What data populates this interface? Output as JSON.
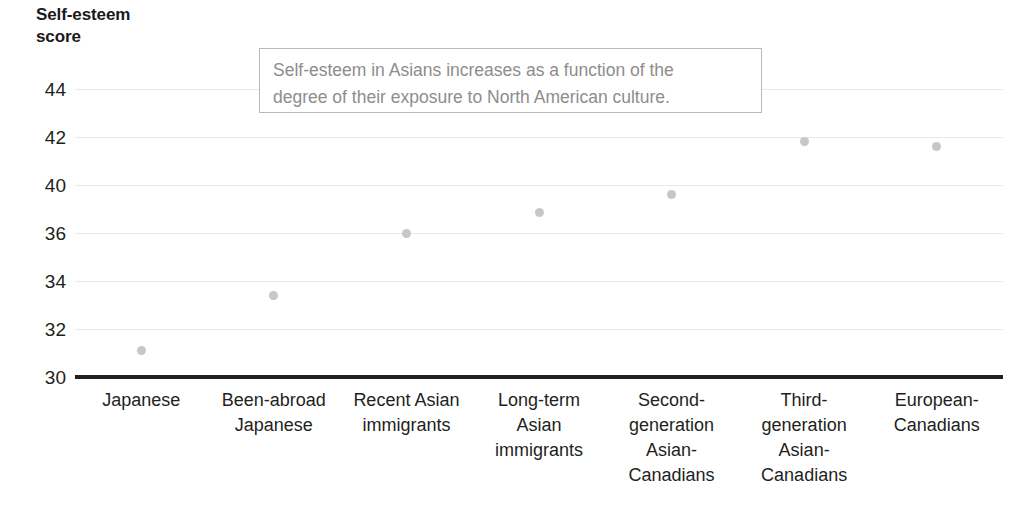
{
  "chart_data": {
    "type": "scatter",
    "ylabel": "Self-esteem score",
    "xlabel": "",
    "categories": [
      "Japanese",
      "Been-abroad Japanese",
      "Recent Asian immigrants",
      "Long-term Asian immigrants",
      "Second-generation Asian-Canadians",
      "Third-generation Asian-Canadians",
      "European-Canadians"
    ],
    "category_lines": [
      [
        "Japanese"
      ],
      [
        "Been-abroad",
        "Japanese"
      ],
      [
        "Recent Asian",
        "immigrants"
      ],
      [
        "Long-term",
        "Asian",
        "immigrants"
      ],
      [
        "Second-",
        "generation",
        "Asian-",
        "Canadians"
      ],
      [
        "Third-",
        "generation",
        "Asian-",
        "Canadians"
      ],
      [
        "European-",
        "Canadians"
      ]
    ],
    "values": [
      31.1,
      33.4,
      36.0,
      37.7,
      39.2,
      41.8,
      41.6
    ],
    "ytick_labels": [
      "44",
      "42",
      "40",
      "36",
      "34",
      "32",
      "30"
    ],
    "ylim": [
      30,
      44
    ],
    "grid": true,
    "legend": "none",
    "annotations": [
      {
        "text": "Self-esteem in Asians increases as a function of the degree of their exposure to North American culture.",
        "line1": "Self-esteem in Asians increases as a function of the",
        "line2": "degree of their exposure to North American culture."
      }
    ],
    "colors": {
      "marker": "#c6c7c9",
      "axis": "#231f20",
      "grid": "#e9e9e9",
      "annotation_text": "#8d8d8d",
      "annotation_border": "#b9b9b9",
      "tick_text": "#231f20",
      "title_text": "#1a1a1a"
    }
  }
}
